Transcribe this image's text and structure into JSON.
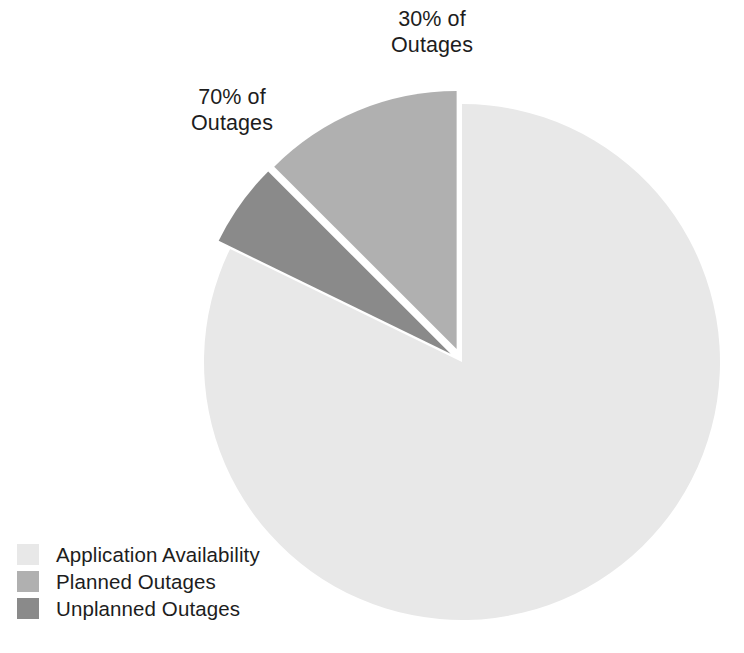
{
  "chart_data": {
    "type": "pie",
    "title": "",
    "categories": [
      "Application Availability",
      "Planned Outages",
      "Unplanned Outages"
    ],
    "values": [
      82.2,
      12.5,
      5.3
    ],
    "unit": "percent",
    "legend_position": "bottom-left",
    "exploded_slices": [
      "Planned Outages",
      "Unplanned Outages"
    ],
    "annotations": [
      {
        "text": "70% of\nOutages",
        "refers_to": "Planned Outages",
        "value": 70,
        "unit": "% of Outages"
      },
      {
        "text": "30% of\nOutages",
        "refers_to": "Unplanned Outages",
        "value": 30,
        "unit": "% of Outages"
      }
    ],
    "slices": [
      {
        "name": "Application Availability",
        "color": "#e8e8e8",
        "start_angle": 0,
        "end_angle": 296,
        "exploded": false,
        "explode_offset": 0
      },
      {
        "name": "Planned Outages",
        "color": "#b0b0b0",
        "start_angle": 315,
        "end_angle": 360,
        "exploded": true,
        "explode_offset": 14
      },
      {
        "name": "Unplanned Outages",
        "color": "#8a8a8a",
        "start_angle": 296,
        "end_angle": 315,
        "exploded": true,
        "explode_offset": 14
      }
    ],
    "geometry": {
      "center_x": 462,
      "center_y": 362,
      "radius": 258
    }
  },
  "labels": {
    "unplanned_callout": "30% of\nOutages",
    "planned_callout": "70% of\nOutages"
  },
  "legend": {
    "items": [
      {
        "label": "Application Availability",
        "color": "#e8e8e8"
      },
      {
        "label": "Planned Outages",
        "color": "#b0b0b0"
      },
      {
        "label": "Unplanned Outages",
        "color": "#8a8a8a"
      }
    ]
  },
  "colors": {
    "background": "#ffffff",
    "text": "#1d1d1d",
    "availability": "#e8e8e8",
    "planned": "#b0b0b0",
    "unplanned": "#8a8a8a"
  }
}
